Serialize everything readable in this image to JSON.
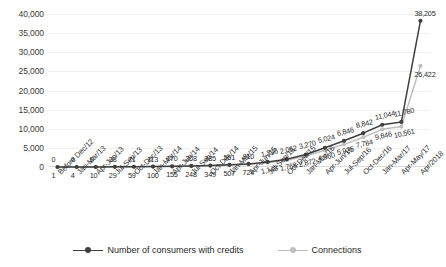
{
  "chart_data": {
    "type": "line",
    "title": "",
    "xlabel": "",
    "ylabel": "",
    "ylim": [
      0,
      40000
    ],
    "yticks": [
      "0",
      "5,000",
      "10,000",
      "15,000",
      "20,000",
      "25,000",
      "30,000",
      "35,000",
      "40,000"
    ],
    "ytick_values": [
      0,
      5000,
      10000,
      15000,
      20000,
      25000,
      30000,
      35000,
      40000
    ],
    "grid": true,
    "legend_position": "bottom",
    "categories": [
      "Before Dec/12",
      "Jan-Mar/13",
      "Apr-Jun/13",
      "Jul-Sep/13",
      "Oct-Dec/13",
      "Jan-Mar/14",
      "Apr-Jun/14",
      "Jul-Sep/14",
      "Oct-Dec/14",
      "Jan-Mar/15",
      "Apr-Jun/15",
      "Jul-Sep/15",
      "Oct-Dec/15",
      "Jan-Mar/16",
      "Apr-Jun/16",
      "Jul-Sep/16",
      "Oct-Dec/16",
      "Jan-Mar/17",
      "Apr-May/17",
      "Apr/2018"
    ],
    "series": [
      {
        "name": "Number of consumers with credits",
        "color": "#3f3f3f",
        "values": [
          0,
          0,
          0,
          38,
          71,
          113,
          170,
          268,
          385,
          561,
          810,
          1336,
          2052,
          3270,
          5024,
          6846,
          8842,
          11044,
          11780,
          38205
        ],
        "labels": [
          "0",
          "0",
          "0",
          "38",
          "71",
          "113",
          "170",
          "268",
          "385",
          "561",
          "810",
          "1,336",
          "2,052",
          "3,270",
          "5,024",
          "6,846",
          "8,842",
          "11,044",
          "11,780",
          "38,205"
        ]
      },
      {
        "name": "Connections",
        "color": "#bfbfbf",
        "values": [
          1,
          4,
          10,
          29,
          59,
          100,
          155,
          248,
          349,
          507,
          724,
          1143,
          1768,
          2872,
          4360,
          5925,
          7784,
          9846,
          10561,
          26422
        ],
        "labels": [
          "1",
          "4",
          "10",
          "29",
          "59",
          "100",
          "155",
          "248",
          "349",
          "507",
          "724",
          "1,143",
          "1,768",
          "2,872",
          "4,360",
          "5,925",
          "7,784",
          "9,846",
          "10,561",
          "26,422"
        ]
      }
    ]
  },
  "legend": {
    "items": [
      {
        "label": "Number of consumers with credits",
        "color": "#3f3f3f"
      },
      {
        "label": "Connections",
        "color": "#bfbfbf"
      }
    ]
  }
}
